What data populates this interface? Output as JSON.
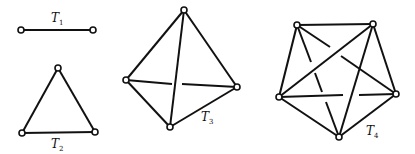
{
  "figure": {
    "graphs": [
      {
        "label": "T",
        "subscript": "1",
        "vertices": 2
      },
      {
        "label": "T",
        "subscript": "2",
        "vertices": 3
      },
      {
        "label": "T",
        "subscript": "3",
        "vertices": 4
      },
      {
        "label": "T",
        "subscript": "4",
        "vertices": 5
      }
    ],
    "colors": {
      "line": "#111111",
      "background": "#ffffff"
    }
  }
}
